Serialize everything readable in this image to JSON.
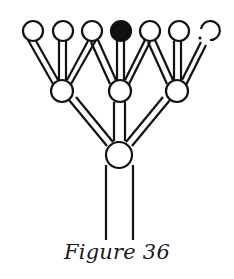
{
  "caption": "Figure 36",
  "colors": {
    "stroke": "#111111",
    "filled": "#111111",
    "background": "#ffffff"
  },
  "tree": {
    "top_nodes": [
      {
        "id": "t1",
        "state": "open"
      },
      {
        "id": "t2",
        "state": "open"
      },
      {
        "id": "t3",
        "state": "open"
      },
      {
        "id": "t4",
        "state": "filled"
      },
      {
        "id": "t5",
        "state": "open"
      },
      {
        "id": "t6",
        "state": "open"
      },
      {
        "id": "t7",
        "state": "broken"
      }
    ],
    "middle_nodes": [
      {
        "id": "m1"
      },
      {
        "id": "m2"
      },
      {
        "id": "m3"
      }
    ],
    "root_node": {
      "id": "r"
    }
  }
}
